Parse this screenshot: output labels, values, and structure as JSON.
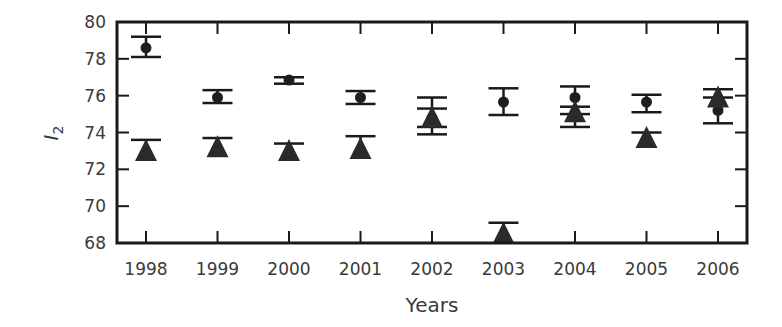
{
  "chart_data": {
    "type": "scatter",
    "title": "",
    "xlabel": "Years",
    "ylabel": "I2",
    "ylabel_main": "I",
    "ylabel_sub": "2",
    "categories": [
      "1998",
      "1999",
      "2000",
      "2001",
      "2002",
      "2003",
      "2004",
      "2005",
      "2006"
    ],
    "ylim": [
      68,
      80
    ],
    "yticks": [
      68,
      70,
      72,
      74,
      76,
      78,
      80
    ],
    "grid": false,
    "legend": null,
    "series": [
      {
        "name": "circles",
        "marker": "circle",
        "color": "#1e1e1e",
        "values": [
          78.6,
          75.9,
          76.85,
          75.9,
          74.8,
          75.65,
          75.9,
          75.65,
          75.2
        ],
        "err_low": [
          78.1,
          75.6,
          76.65,
          75.55,
          73.9,
          74.95,
          75.4,
          75.1,
          74.5
        ],
        "err_high": [
          79.2,
          76.3,
          77.0,
          76.25,
          75.9,
          76.4,
          76.5,
          76.05,
          75.9
        ]
      },
      {
        "name": "triangles",
        "marker": "triangle",
        "color": "#2a2a2a",
        "values": [
          73.0,
          73.2,
          73.0,
          73.1,
          74.8,
          68.5,
          75.1,
          73.7,
          75.9
        ],
        "err_low": [
          73.0,
          73.2,
          73.0,
          73.1,
          74.3,
          68.5,
          74.3,
          73.7,
          75.9
        ],
        "err_high": [
          73.6,
          73.7,
          73.4,
          73.8,
          75.3,
          69.1,
          75.0,
          74.0,
          76.35
        ]
      }
    ]
  }
}
